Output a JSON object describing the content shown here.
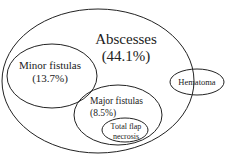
{
  "diagram": {
    "type": "venn-euler",
    "sets": [
      {
        "id": "abscesses",
        "label": "Abscesses",
        "value": "(44.1%)"
      },
      {
        "id": "minor_fistulas",
        "label": "Minor fistulas",
        "value": "(13.7%)"
      },
      {
        "id": "major_fistulas",
        "label": "Major fistulas",
        "value": "(8.5%)"
      },
      {
        "id": "total_flap_necrosis",
        "label_line1": "Total flap",
        "label_line2": "necrosis"
      },
      {
        "id": "hematoma",
        "label": "Hematoma"
      }
    ]
  }
}
